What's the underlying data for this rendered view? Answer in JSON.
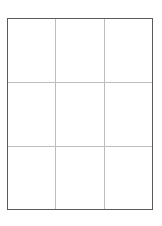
{
  "diagram": {
    "type": "grid",
    "rows": 3,
    "columns": 3,
    "border_color": "#5a5a5a",
    "divider_color": "#bdbdbd",
    "background_color": "#ffffff",
    "cells": [
      {
        "row": 1,
        "col": 1,
        "label": ""
      },
      {
        "row": 1,
        "col": 2,
        "label": ""
      },
      {
        "row": 1,
        "col": 3,
        "label": ""
      },
      {
        "row": 2,
        "col": 1,
        "label": ""
      },
      {
        "row": 2,
        "col": 2,
        "label": ""
      },
      {
        "row": 2,
        "col": 3,
        "label": ""
      },
      {
        "row": 3,
        "col": 1,
        "label": ""
      },
      {
        "row": 3,
        "col": 2,
        "label": ""
      },
      {
        "row": 3,
        "col": 3,
        "label": ""
      }
    ]
  }
}
